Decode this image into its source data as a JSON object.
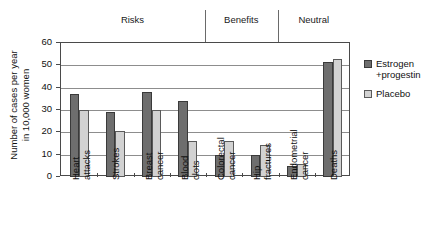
{
  "chart_data": {
    "type": "bar",
    "title": "",
    "xlabel": "",
    "ylabel": "Number of cases per year\nin 10,000 women",
    "ylim": [
      0,
      60
    ],
    "yticks": [
      0,
      10,
      20,
      30,
      40,
      50,
      60
    ],
    "grid": true,
    "legend_position": "right",
    "categories": [
      "Heart\nattacks",
      "Strokes",
      "Breast\ncancer",
      "Blood\nclots",
      "Colorectal\ncancer",
      "Hip\nfractures",
      "Endometrial\ncancer",
      "Deaths"
    ],
    "series": [
      {
        "name": "Estrogen\n+progestin",
        "color": "#6e6e6e",
        "values": [
          37,
          29,
          38,
          34,
          10,
          10,
          5,
          51.5
        ]
      },
      {
        "name": "Placebo",
        "color": "#d2d2d2",
        "values": [
          30,
          20.5,
          30,
          16,
          16,
          14.5,
          6,
          53
        ]
      }
    ],
    "sections": [
      {
        "label": "Risks",
        "categories": [
          "Heart attacks",
          "Strokes",
          "Breast cancer",
          "Blood clots"
        ]
      },
      {
        "label": "Benefits",
        "categories": [
          "Colorectal cancer",
          "Hip fractures"
        ]
      },
      {
        "label": "Neutral",
        "categories": [
          "Endometrial cancer",
          "Deaths"
        ]
      }
    ]
  },
  "legend": {
    "items": [
      {
        "label": "Estrogen\n+progestin"
      },
      {
        "label": "Placebo"
      }
    ]
  }
}
